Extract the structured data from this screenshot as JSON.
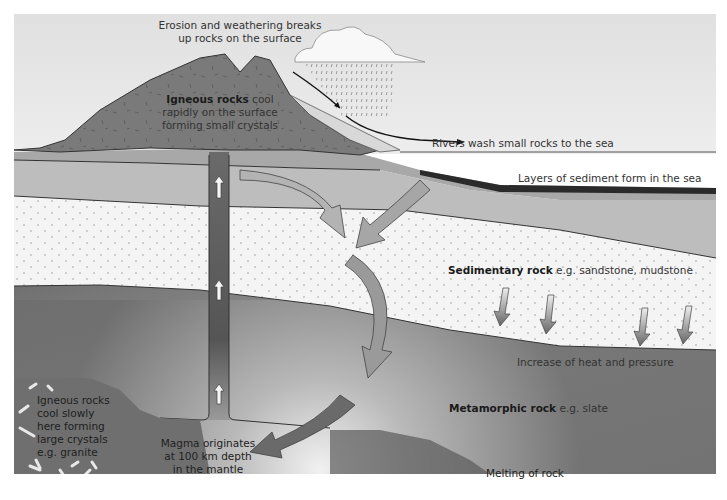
{
  "diagram": {
    "labels": {
      "erosion": [
        "Erosion and weathering breaks",
        "up rocks on the surface"
      ],
      "igneous_surface_bold": "Igneous rocks",
      "igneous_surface_rest": " cool",
      "igneous_surface_lines": [
        "rapidly on the surface",
        "forming small crystals"
      ],
      "rivers": "Rivers wash small rocks to the sea",
      "sediment_layers": "Layers of sediment form in the sea",
      "sedimentary_bold": "Sedimentary rock",
      "sedimentary_rest": " e.g. sandstone, mudstone",
      "heat_pressure": "Increase of heat and pressure",
      "metamorphic_bold": "Metamorphic rock",
      "metamorphic_rest": " e.g. slate",
      "igneous_deep": [
        "Igneous rocks",
        "cool slowly",
        "here forming",
        "large crystals",
        "e.g. granite"
      ],
      "magma": [
        "Magma originates",
        "at 100 km depth",
        "in the mantle"
      ],
      "melting": "Melting of rock"
    },
    "icons": [
      "cloud-icon",
      "rain-icon",
      "up-arrow-icon",
      "down-arrow-icon",
      "cycle-arrow-icon"
    ],
    "colors": {
      "sky": "#e4e4e4",
      "volcano": "#7a7a7a",
      "sediment_band": "#bdbdbd",
      "sedimentary": "#f4f4f4",
      "metamorphic": "#8a8a8a",
      "magma_glow": "#ffffff",
      "dark_line": "#2a2a2a"
    }
  }
}
